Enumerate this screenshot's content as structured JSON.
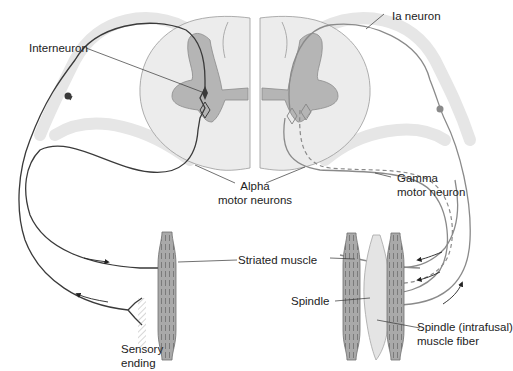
{
  "diagram": {
    "labels": {
      "interneuron": "Interneuron",
      "ia_neuron": "Ia neuron",
      "alpha_line1": "Alpha",
      "alpha_line2": "motor neurons",
      "gamma_line1": "Gamma",
      "gamma_line2": "motor neuron",
      "striated_muscle": "Striated muscle",
      "spindle": "Spindle",
      "spindle_fiber_line1": "Spindle (intrafusal)",
      "spindle_fiber_line2": "muscle fiber",
      "sensory_line1": "Sensory",
      "sensory_line2": "ending"
    },
    "colors": {
      "white_matter": "#ececec",
      "gray_matter": "#b5b5b5",
      "gray_matter_stroke": "#8a8a8a",
      "left_neuron": "#3a3a3a",
      "right_neuron": "#8a8a8a",
      "muscle": "#a9a9a9",
      "spindle": "#e4e4e4",
      "nerve_sheath": "#e8e8e8",
      "text": "#222222"
    }
  }
}
